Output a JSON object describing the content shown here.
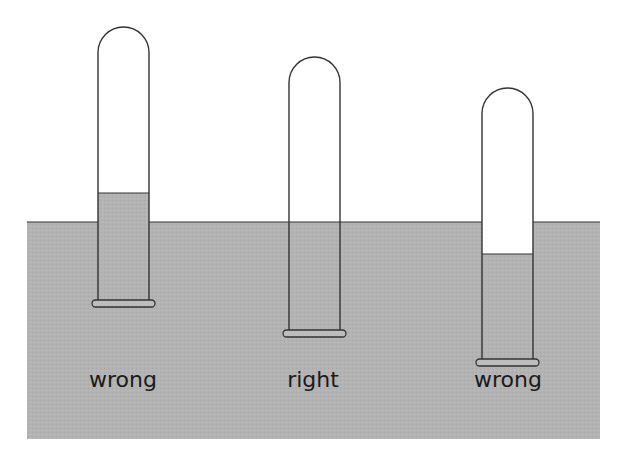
{
  "diagram": {
    "colors": {
      "water": "#b3b3b3",
      "outline": "#333333",
      "background": "#ffffff",
      "tube_air": "#ffffff"
    },
    "trough": {
      "x": 27,
      "y": 222,
      "width": 573,
      "height": 217
    },
    "tubes": [
      {
        "id": "tube-1",
        "label": "wrong",
        "x": 98,
        "width": 51,
        "top": 27,
        "liquid_level": 193,
        "bottom": 301,
        "label_x": 123,
        "label_y": 371
      },
      {
        "id": "tube-2",
        "label": "right",
        "x": 289,
        "width": 51,
        "top": 57,
        "liquid_level": 222,
        "bottom": 331,
        "label_x": 313,
        "label_y": 371
      },
      {
        "id": "tube-3",
        "label": "wrong",
        "x": 482,
        "width": 51,
        "top": 88,
        "liquid_level": 254,
        "bottom": 360,
        "label_x": 508,
        "label_y": 371
      }
    ]
  }
}
